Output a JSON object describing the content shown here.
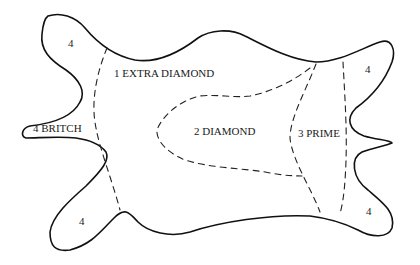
{
  "diagram": {
    "type": "leather-hide-grading-map",
    "regions": [
      {
        "id": "extra-diamond",
        "label": "1 EXTRA DIAMOND"
      },
      {
        "id": "diamond",
        "label": "2 DIAMOND"
      },
      {
        "id": "prime",
        "label": "3 PRIME"
      },
      {
        "id": "britch",
        "label": "4 BRITCH"
      }
    ],
    "corner_labels": {
      "top_left": "4",
      "top_right": "4",
      "bottom_left": "4",
      "bottom_right": "4"
    },
    "colors": {
      "outline": "#111111",
      "cut_lines": "#222222",
      "background": "#ffffff"
    }
  }
}
